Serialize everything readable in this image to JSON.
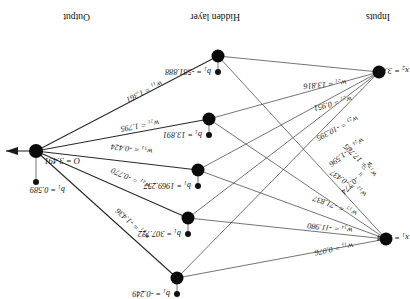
{
  "figure": {
    "orientation": "rotated-180",
    "column_headers": [
      {
        "name": "inputs",
        "label": "Inputs"
      },
      {
        "name": "hidden-layer",
        "label": "Hidden layer"
      },
      {
        "name": "output",
        "label": "Output"
      }
    ],
    "inputs": [
      {
        "id": "x1",
        "label": "x",
        "sub": "1",
        "value": "25.4",
        "text": "x₁ = 25.4"
      },
      {
        "id": "x2",
        "label": "x",
        "sub": "2",
        "value": "3.81",
        "text": "x₂ = 3.81"
      }
    ],
    "output": {
      "id": "O",
      "text": "O = 3.491",
      "value": "3.491",
      "bias": "b₁ = 0.589",
      "bias_value": "0.589"
    },
    "hidden_biases": [
      {
        "node": 1,
        "text": "b₁ = -581.888",
        "value": "-581.888"
      },
      {
        "node": 2,
        "text": "b₁ = 13.891",
        "value": "13.891"
      },
      {
        "node": 3,
        "text": "b₁ = 1969.257",
        "value": "1969.257"
      },
      {
        "node": 4,
        "text": "b₁ = 307.722",
        "value": "307.722"
      },
      {
        "node": 5,
        "text": "b₁ = -0.249",
        "value": "-0.249"
      }
    ],
    "input_weights": [
      {
        "id": "w11",
        "text": "w₁₁ = 17.705",
        "value": "17.705"
      },
      {
        "id": "w12",
        "text": "w₁₂ = -0.437",
        "value": "-0.437"
      },
      {
        "id": "w13",
        "text": "w₁₃ = -71.837",
        "value": "-71.837"
      },
      {
        "id": "w14",
        "text": "w₁₄ = -11.980",
        "value": "-11.980"
      },
      {
        "id": "w15",
        "text": "w₁₅ = 0.076",
        "value": "0.076"
      },
      {
        "id": "w21",
        "text": "w₂₁ = 13.816",
        "value": "13.816"
      },
      {
        "id": "w22",
        "text": "w₂₂ = 0.951",
        "value": "0.951"
      },
      {
        "id": "w23",
        "text": "w₂₃ = -10.395",
        "value": "-10.395"
      },
      {
        "id": "w24",
        "text": "w₂₄ = -1.596",
        "value": "-1.596"
      },
      {
        "id": "w25",
        "text": "w₂₅ = -0.774",
        "value": "-0.774"
      }
    ],
    "output_weights": [
      {
        "id": "w11o",
        "text": "w₁₁ = 1.361",
        "value": "1.361"
      },
      {
        "id": "w21o",
        "text": "w₂₁ = 1.795",
        "value": "1.795"
      },
      {
        "id": "w31o",
        "text": "w₃₁ = -0.424",
        "value": "-0.424"
      },
      {
        "id": "w41o",
        "text": "w₄₁ = -0.770",
        "value": "-0.770"
      },
      {
        "id": "w51o",
        "text": "w₅₁ = -1.436",
        "value": "-1.436"
      }
    ]
  }
}
